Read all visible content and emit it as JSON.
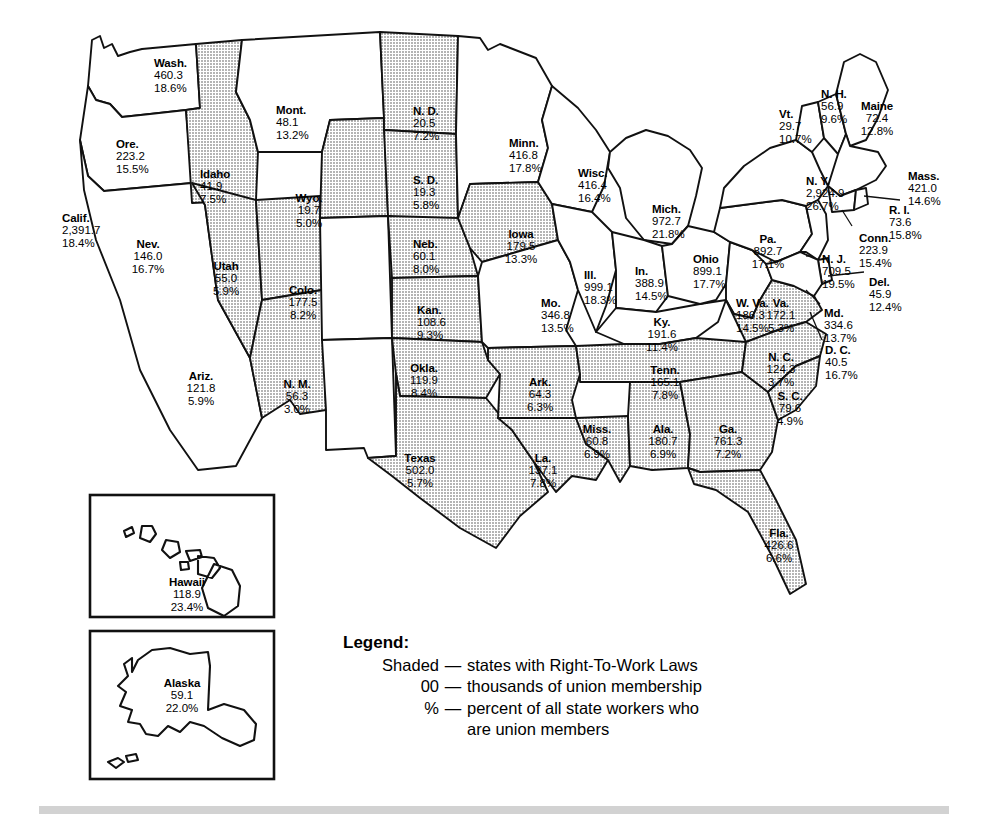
{
  "map": {
    "title": "United States Union Membership by State",
    "shaded_color": "#c9c9c9",
    "plain_color": "#ffffff",
    "border_color": "#111111"
  },
  "legend": {
    "title": "Legend:",
    "rows": [
      {
        "key": "Shaded",
        "dash": "—",
        "text": "states with Right-To-Work Laws"
      },
      {
        "key": "00",
        "dash": "—",
        "text": "thousands of union membership"
      },
      {
        "key": "%",
        "dash": "—",
        "text": "percent of all state workers who"
      }
    ],
    "continuation": "are union members"
  },
  "chart_data": {
    "type": "map",
    "value_units": "thousands of union membership",
    "percent_units": "percent of all state workers who are union members",
    "shading_meaning": "states with Right-To-Work Laws",
    "states": [
      {
        "id": "WA",
        "name": "Wash.",
        "members": "460.3",
        "percent": "18.6%",
        "shaded": false,
        "x": 154,
        "y": 57
      },
      {
        "id": "OR",
        "name": "Ore.",
        "members": "223.2",
        "percent": "15.5%",
        "shaded": false,
        "x": 116,
        "y": 138
      },
      {
        "id": "CA",
        "name": "Calif.",
        "members": "2,391.7",
        "percent": "18.4%",
        "shaded": false,
        "x": 62,
        "y": 212
      },
      {
        "id": "ID",
        "name": "Idaho",
        "members": "41.9",
        "percent": "7.5%",
        "shaded": true,
        "x": 200,
        "y": 168
      },
      {
        "id": "NV",
        "name": "Nev.",
        "members": "146.0",
        "percent": "16.7%",
        "shaded": true,
        "x": 148,
        "y": 238
      },
      {
        "id": "UT",
        "name": "Utah",
        "members": "55.0",
        "percent": "5.9%",
        "shaded": true,
        "x": 226,
        "y": 260
      },
      {
        "id": "AZ",
        "name": "Ariz.",
        "members": "121.8",
        "percent": "5.9%",
        "shaded": true,
        "x": 201,
        "y": 370
      },
      {
        "id": "MT",
        "name": "Mont.",
        "members": "48.1",
        "percent": "13.2%",
        "shaded": false,
        "x": 276,
        "y": 104
      },
      {
        "id": "WY",
        "name": "Wyo.",
        "members": "19.7",
        "percent": "5.0%",
        "shaded": true,
        "x": 309,
        "y": 192
      },
      {
        "id": "CO",
        "name": "Colo.",
        "members": "177.5",
        "percent": "8.2%",
        "shaded": false,
        "x": 303,
        "y": 284
      },
      {
        "id": "NM",
        "name": "N. M.",
        "members": "56.3",
        "percent": "3.0%",
        "shaded": false,
        "x": 297,
        "y": 378
      },
      {
        "id": "ND",
        "name": "N. D.",
        "members": "20.5",
        "percent": "7.2%",
        "shaded": true,
        "x": 413,
        "y": 105
      },
      {
        "id": "SD",
        "name": "S. D.",
        "members": "19.3",
        "percent": "5.8%",
        "shaded": true,
        "x": 413,
        "y": 174
      },
      {
        "id": "NE",
        "name": "Neb.",
        "members": "60.1",
        "percent": "8.0%",
        "shaded": true,
        "x": 413,
        "y": 238
      },
      {
        "id": "KS",
        "name": "Kan.",
        "members": "108.6",
        "percent": "9.3%",
        "shaded": true,
        "x": 417,
        "y": 304
      },
      {
        "id": "OK",
        "name": "Okla.",
        "members": "119.9",
        "percent": "8.4%",
        "shaded": true,
        "x": 424,
        "y": 362
      },
      {
        "id": "TX",
        "name": "Texas",
        "members": "502.0",
        "percent": "5.7%",
        "shaded": true,
        "x": 420,
        "y": 452
      },
      {
        "id": "MN",
        "name": "Minn.",
        "members": "416.8",
        "percent": "17.8%",
        "shaded": false,
        "x": 509,
        "y": 137
      },
      {
        "id": "IA",
        "name": "Iowa",
        "members": "179.5",
        "percent": "13.3%",
        "shaded": true,
        "x": 521,
        "y": 228
      },
      {
        "id": "MO",
        "name": "Mo.",
        "members": "346.8",
        "percent": "13.5%",
        "shaded": false,
        "x": 541,
        "y": 297
      },
      {
        "id": "AR",
        "name": "Ark.",
        "members": "64.3",
        "percent": "6.3%",
        "shaded": true,
        "x": 540,
        "y": 376
      },
      {
        "id": "LA",
        "name": "La.",
        "members": "137.1",
        "percent": "7.8%",
        "shaded": true,
        "x": 543,
        "y": 452
      },
      {
        "id": "WI",
        "name": "Wisc.",
        "members": "416.4",
        "percent": "16.4%",
        "shaded": false,
        "x": 578,
        "y": 167
      },
      {
        "id": "IL",
        "name": "Ill.",
        "members": "999.1",
        "percent": "18.3%",
        "shaded": false,
        "x": 584,
        "y": 269
      },
      {
        "id": "MS",
        "name": "Miss.",
        "members": "60.8",
        "percent": "6.9%",
        "shaded": true,
        "x": 597,
        "y": 423
      },
      {
        "id": "MI",
        "name": "Mich.",
        "members": "972.7",
        "percent": "21.8%",
        "shaded": false,
        "x": 652,
        "y": 203
      },
      {
        "id": "IN",
        "name": "In.",
        "members": "388.9",
        "percent": "14.5%",
        "shaded": false,
        "x": 635,
        "y": 265
      },
      {
        "id": "KY",
        "name": "Ky.",
        "members": "191.6",
        "percent": "11.4%",
        "shaded": false,
        "x": 662,
        "y": 316
      },
      {
        "id": "TN",
        "name": "Tenn.",
        "members": "165.1",
        "percent": "7.8%",
        "shaded": true,
        "x": 665,
        "y": 364
      },
      {
        "id": "AL",
        "name": "Ala.",
        "members": "180.7",
        "percent": "6.9%",
        "shaded": true,
        "x": 663,
        "y": 423
      },
      {
        "id": "OH",
        "name": "Ohio",
        "members": "899.1",
        "percent": "17.7%",
        "shaded": false,
        "x": 693,
        "y": 253
      },
      {
        "id": "GA",
        "name": "Ga.",
        "members": "761.3",
        "percent": "7.2%",
        "shaded": true,
        "x": 728,
        "y": 423
      },
      {
        "id": "FL",
        "name": "Fla.",
        "members": "426.6",
        "percent": "6.6%",
        "shaded": true,
        "x": 779,
        "y": 527
      },
      {
        "id": "WV",
        "name": "W. Va.",
        "members": "186.3",
        "percent": "14.5%",
        "shaded": false,
        "x": 736,
        "y": 297
      },
      {
        "id": "VA",
        "name": "Va.",
        "members": "172.1",
        "percent": "5.3%",
        "shaded": true,
        "x": 781,
        "y": 297
      },
      {
        "id": "NC",
        "name": "N. C.",
        "members": "124.3",
        "percent": "3.7%",
        "shaded": true,
        "x": 781,
        "y": 351
      },
      {
        "id": "SC",
        "name": "S. C.",
        "members": "79.6",
        "percent": "4.9%",
        "shaded": true,
        "x": 790,
        "y": 390
      },
      {
        "id": "PA",
        "name": "Pa.",
        "members": "892.7",
        "percent": "17.1%",
        "shaded": false,
        "x": 768,
        "y": 233
      },
      {
        "id": "NY",
        "name": "N. Y.",
        "members": "2,924.9",
        "percent": "26.7%",
        "shaded": false,
        "x": 806,
        "y": 175
      },
      {
        "id": "VT",
        "name": "Vt.",
        "members": "29.7",
        "percent": "10.7%",
        "shaded": false,
        "x": 779,
        "y": 108
      },
      {
        "id": "NH",
        "name": "N. H.",
        "members": "56.9",
        "percent": "9.6%",
        "shaded": false,
        "x": 821,
        "y": 88
      },
      {
        "id": "ME",
        "name": "Maine",
        "members": "72.4",
        "percent": "12.8%",
        "shaded": false,
        "x": 877,
        "y": 100
      },
      {
        "id": "MA",
        "name": "Mass.",
        "members": "421.0",
        "percent": "14.6%",
        "shaded": false,
        "x": 908,
        "y": 170
      },
      {
        "id": "RI",
        "name": "R. I.",
        "members": "73.6",
        "percent": "15.8%",
        "shaded": false,
        "x": 889,
        "y": 204
      },
      {
        "id": "CT",
        "name": "Conn.",
        "members": "223.9",
        "percent": "15.4%",
        "shaded": false,
        "x": 859,
        "y": 232
      },
      {
        "id": "NJ",
        "name": "N. J.",
        "members": "709.5",
        "percent": "19.5%",
        "shaded": false,
        "x": 822,
        "y": 253
      },
      {
        "id": "DE",
        "name": "Del.",
        "members": "45.9",
        "percent": "12.4%",
        "shaded": false,
        "x": 869,
        "y": 276
      },
      {
        "id": "MD",
        "name": "Md.",
        "members": "334.6",
        "percent": "13.7%",
        "shaded": false,
        "x": 824,
        "y": 307
      },
      {
        "id": "DC",
        "name": "D. C.",
        "members": "40.5",
        "percent": "16.7%",
        "shaded": false,
        "x": 825,
        "y": 344
      },
      {
        "id": "HI",
        "name": "Hawaii",
        "members": "118.9",
        "percent": "23.4%",
        "shaded": false,
        "x": 187,
        "y": 576
      },
      {
        "id": "AK",
        "name": "Alaska",
        "members": "59.1",
        "percent": "22.0%",
        "shaded": false,
        "x": 182,
        "y": 677
      }
    ]
  }
}
